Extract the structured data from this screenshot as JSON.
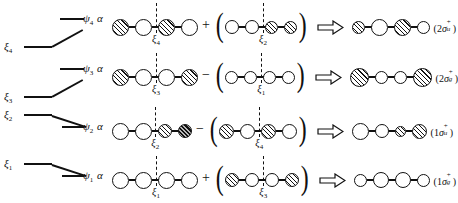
{
  "figure": {
    "levels": [
      {
        "energy_label": "ξ",
        "energy_sub": "4",
        "psi_label": "ψ",
        "psi_sub": "4",
        "alpha": "α"
      },
      {
        "energy_label": "ξ",
        "energy_sub": "3",
        "psi_label": "ψ",
        "psi_sub": "3",
        "alpha": "α"
      },
      {
        "energy_label": "ξ",
        "energy_sub": "2",
        "psi_label": "ψ",
        "psi_sub": "2",
        "alpha": "α"
      },
      {
        "energy_label": "ξ",
        "energy_sub": "1",
        "psi_label": "ψ",
        "psi_sub": "1",
        "alpha": "α"
      }
    ],
    "rows": [
      {
        "id": "row-psi4",
        "operator": "+",
        "term1": {
          "nodes": [
            "hatch",
            "white",
            "hatch",
            "white"
          ],
          "sizes": [
            17,
            17,
            17,
            17
          ],
          "divider_after": 2,
          "divider_tag": "ξ",
          "divider_tag_sub": "4"
        },
        "term2": {
          "nodes": [
            "white",
            "white",
            "hatch",
            "hatch"
          ],
          "sizes": [
            14,
            14,
            13,
            13
          ],
          "divider_after": 2,
          "divider_tag": "ξ",
          "divider_tag_sub": "2"
        },
        "result": {
          "nodes": [
            "hatch",
            "white",
            "hatch",
            "white"
          ],
          "sizes": [
            13,
            17,
            17,
            13
          ]
        },
        "result_label": {
          "prefix": "(2",
          "sigma": "σ",
          "sup": "+",
          "sub": "u",
          "suffix": ")"
        }
      },
      {
        "id": "row-psi3",
        "operator": "−",
        "term1": {
          "nodes": [
            "hatch",
            "white",
            "white",
            "hatch"
          ],
          "sizes": [
            17,
            17,
            17,
            17
          ],
          "divider_after": 2,
          "divider_tag": "ξ",
          "divider_tag_sub": "3"
        },
        "term2": {
          "nodes": [
            "white",
            "white",
            "white",
            "white"
          ],
          "sizes": [
            13,
            13,
            13,
            13
          ],
          "divider_after": 2,
          "divider_tag": "ξ",
          "divider_tag_sub": "1"
        },
        "result": {
          "nodes": [
            "hatch",
            "white",
            "white",
            "hatch"
          ],
          "sizes": [
            19,
            13,
            13,
            19
          ]
        },
        "result_label": {
          "prefix": "(2",
          "sigma": "σ",
          "sup": "+",
          "sub": "g",
          "suffix": ")"
        }
      },
      {
        "id": "row-psi2",
        "operator": "−",
        "term1": {
          "nodes": [
            "white",
            "white",
            "hatch",
            "dark"
          ],
          "sizes": [
            17,
            17,
            14,
            14
          ],
          "divider_after": 2,
          "divider_tag": "ξ",
          "divider_tag_sub": "2"
        },
        "term2": {
          "nodes": [
            "hatch",
            "white",
            "hatch",
            "white"
          ],
          "sizes": [
            15,
            15,
            15,
            15
          ],
          "divider_after": 2,
          "divider_tag": "ξ",
          "divider_tag_sub": "4"
        },
        "result": {
          "nodes": [
            "white",
            "white",
            "hatch",
            "hatch"
          ],
          "sizes": [
            17,
            14,
            11,
            15
          ]
        },
        "result_label": {
          "prefix": "(1",
          "sigma": "σ",
          "sup": "+",
          "sub": "u",
          "suffix": ")"
        }
      },
      {
        "id": "row-psi1",
        "operator": "+",
        "term1": {
          "nodes": [
            "white",
            "white",
            "white",
            "white"
          ],
          "sizes": [
            17,
            17,
            17,
            17
          ],
          "divider_after": 2,
          "divider_tag": "ξ",
          "divider_tag_sub": "1"
        },
        "term2": {
          "nodes": [
            "hatch",
            "white",
            "white",
            "hatch"
          ],
          "sizes": [
            14,
            14,
            14,
            14
          ],
          "divider_after": 2,
          "divider_tag": "ξ",
          "divider_tag_sub": "3"
        },
        "result": {
          "nodes": [
            "white",
            "white",
            "white",
            "white"
          ],
          "sizes": [
            13,
            16,
            16,
            13
          ]
        },
        "result_label": {
          "prefix": "(1",
          "sigma": "σ",
          "sup": "+",
          "sub": "g",
          "suffix": ")"
        }
      }
    ],
    "colors": {
      "ink": "#111111",
      "background": "#ffffff",
      "hatch": "#111111",
      "dark_fill": "#b9b9b9"
    }
  }
}
